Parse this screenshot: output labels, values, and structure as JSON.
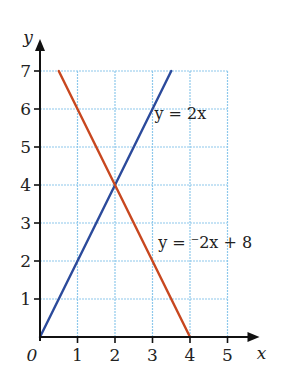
{
  "chart_data": {
    "type": "line",
    "title": "",
    "xlabel": "x",
    "ylabel": "y",
    "origin_label": "0",
    "xlim": [
      0,
      5
    ],
    "ylim": [
      0,
      7
    ],
    "grid": true,
    "x_ticks": [
      1,
      2,
      3,
      4,
      5
    ],
    "y_ticks": [
      1,
      2,
      3,
      4,
      5,
      6,
      7
    ],
    "x_tick_labels": [
      "1",
      "2",
      "3",
      "4",
      "5"
    ],
    "y_tick_labels": [
      "1",
      "2",
      "3",
      "4",
      "5",
      "6",
      "7"
    ],
    "series": [
      {
        "name": "y = 2x",
        "equation": "y = 2x",
        "color": "#2b4a9b",
        "points": [
          [
            0,
            0
          ],
          [
            3.5,
            7
          ]
        ]
      },
      {
        "name": "y = −2x + 8",
        "equation": "y = ⁻2x + 8",
        "color": "#c8471f",
        "points": [
          [
            0.5,
            7
          ],
          [
            4,
            0
          ]
        ]
      }
    ],
    "annotations": [
      {
        "text": "y = 2x",
        "series": 0
      },
      {
        "text": "y = ⁻2x + 8",
        "series": 1
      }
    ],
    "intersection": [
      2,
      4
    ]
  },
  "colors": {
    "grid": "#8ec8ec",
    "axis": "#111111"
  }
}
